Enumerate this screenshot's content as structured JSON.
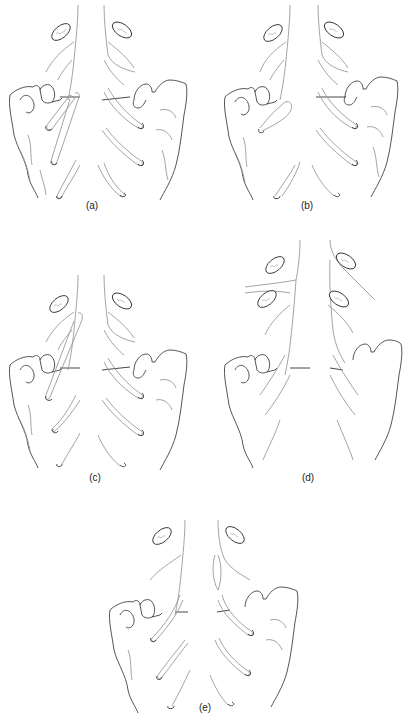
{
  "figure": {
    "panels": [
      {
        "id": "a",
        "label": "(a)",
        "x": 0,
        "y": 0,
        "label_x": 92,
        "label_y": 207
      },
      {
        "id": "b",
        "label": "(b)",
        "x": 200,
        "y": 0,
        "label_x": 307,
        "label_y": 207
      },
      {
        "id": "c",
        "label": "(c)",
        "x": 0,
        "y": 235,
        "label_x": 95,
        "label_y": 472
      },
      {
        "id": "d",
        "label": "(d)",
        "x": 205,
        "y": 235,
        "label_x": 308,
        "label_y": 472
      },
      {
        "id": "e",
        "label": "(e)",
        "x": 100,
        "y": 475,
        "label_x": 205,
        "label_y": 708
      }
    ],
    "colors": {
      "outline": "#2a2a2a",
      "structure": "#9a9a9a",
      "background": "#ffffff"
    }
  }
}
